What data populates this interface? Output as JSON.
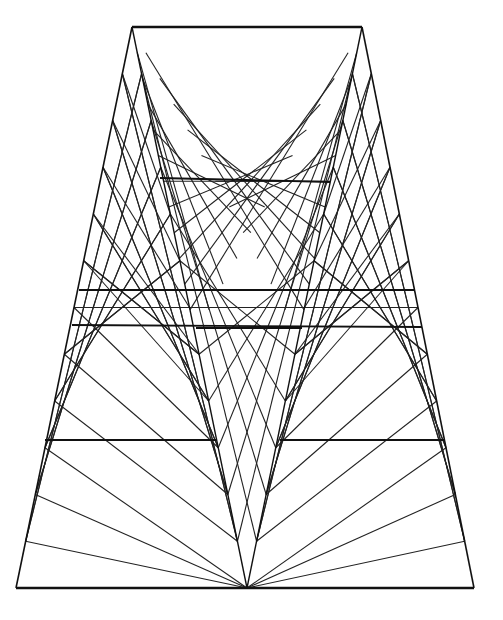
{
  "title": "String-art geometric line drawing",
  "colors": {
    "background": "#ffffff",
    "stroke": "#222222",
    "frame": "#111111"
  },
  "frame": {
    "top": [
      [
        132,
        27
      ],
      [
        362,
        27
      ]
    ],
    "bottom": [
      [
        16,
        588
      ],
      [
        474,
        588
      ]
    ],
    "left_outer": [
      [
        132,
        27
      ],
      [
        16,
        588
      ]
    ],
    "right_outer": [
      [
        362,
        27
      ],
      [
        474,
        588
      ]
    ],
    "apex_mid": [
      247,
      588
    ],
    "inner_left": [
      [
        132,
        27
      ],
      [
        247,
        588
      ]
    ],
    "inner_right": [
      [
        362,
        27
      ],
      [
        247,
        588
      ]
    ]
  },
  "bars": [
    [
      [
        79,
        290
      ],
      [
        415,
        290
      ]
    ],
    [
      [
        72,
        325
      ],
      [
        422,
        327
      ]
    ],
    [
      [
        196,
        328
      ],
      [
        302,
        328
      ]
    ],
    [
      [
        160,
        178
      ],
      [
        330,
        182
      ]
    ],
    [
      [
        45,
        440
      ],
      [
        216,
        440
      ]
    ],
    [
      [
        280,
        440
      ],
      [
        445,
        440
      ]
    ]
  ],
  "string_count": 12
}
